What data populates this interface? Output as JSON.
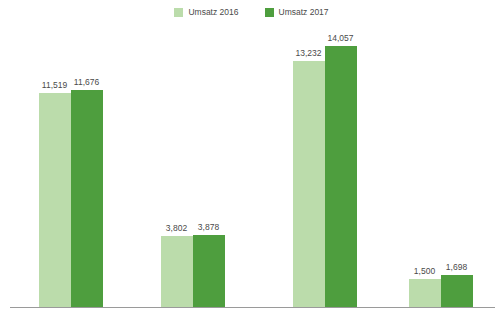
{
  "chart_data": {
    "type": "bar",
    "title": "",
    "subtitle": "",
    "xlabel": "",
    "ylabel": "",
    "grid": false,
    "legend_position": "top-center",
    "axis_visible": "x-only",
    "ylim": [
      0,
      14057
    ],
    "categories": [
      "Personenverkehr",
      "Güterverkehr",
      "Spedition",
      "Sonstiges"
    ],
    "series": [
      {
        "name": "Umsatz 2016",
        "color": "#bbdcab",
        "values": [
          11519,
          3802,
          13232,
          1500
        ],
        "labels": [
          "11,519",
          "3,802",
          "13,232",
          "1,500"
        ]
      },
      {
        "name": "Umsatz 2017",
        "color": "#4e9e3e",
        "values": [
          11676,
          3878,
          14057,
          1698
        ],
        "labels": [
          "11,676",
          "3,878",
          "14,057",
          "1,698"
        ]
      }
    ]
  },
  "legend": {
    "items": [
      {
        "label": "Umsatz 2016",
        "color": "#bbdcab",
        "swatch_name": "legend-swatch-umsatz-2016"
      },
      {
        "label": "Umsatz 2017",
        "color": "#4e9e3e",
        "swatch_name": "legend-swatch-umsatz-2017"
      }
    ]
  },
  "axis": {
    "line_color": "#9a9a9a",
    "label_color": "#4a4a4a"
  }
}
